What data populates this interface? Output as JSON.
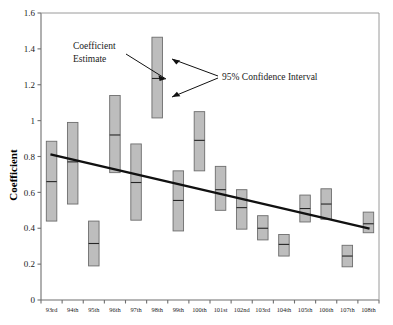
{
  "chart_data": {
    "type": "bar",
    "title": "",
    "subtitle": "",
    "xlabel": "",
    "ylabel": "Coefficient",
    "ylim": [
      0,
      1.6
    ],
    "yticks": [
      "0",
      "0.2",
      "0.4",
      "0.6",
      "0.8",
      "1",
      "1.2",
      "1.4",
      "1.6"
    ],
    "ytick_values": [
      0,
      0.2,
      0.4,
      0.6,
      0.8,
      1.0,
      1.2,
      1.4,
      1.6
    ],
    "grid": false,
    "legend_position": "none",
    "categories": [
      "93rd",
      "94th",
      "95th",
      "96th",
      "97th",
      "98th",
      "99th",
      "100th",
      "101st",
      "102nd",
      "103rd",
      "104th",
      "105th",
      "106th",
      "107th",
      "108th"
    ],
    "series": [
      {
        "name": "Coefficient Estimate",
        "values": [
          0.66,
          0.77,
          0.315,
          0.92,
          0.655,
          1.235,
          0.555,
          0.89,
          0.615,
          0.515,
          0.4,
          0.31,
          0.51,
          0.535,
          0.245,
          0.425
        ]
      },
      {
        "name": "95% Confidence Interval Upper",
        "values": [
          0.885,
          0.99,
          0.44,
          1.14,
          0.87,
          1.465,
          0.72,
          1.05,
          0.745,
          0.615,
          0.47,
          0.365,
          0.585,
          0.62,
          0.305,
          0.49
        ]
      },
      {
        "name": "95% Confidence Interval Lower",
        "values": [
          0.44,
          0.535,
          0.19,
          0.71,
          0.445,
          1.015,
          0.385,
          0.72,
          0.5,
          0.395,
          0.335,
          0.245,
          0.435,
          0.45,
          0.185,
          0.375
        ]
      }
    ],
    "trend_line": {
      "name": "fitted trend",
      "x_start_category": "93rd",
      "x_end_category": "108th",
      "y_start": 0.81,
      "y_end": 0.4
    },
    "annotations": [
      {
        "id": "coefficient-estimate",
        "text": "Coefficient",
        "text_line2": "Estimate"
      },
      {
        "id": "confidence-interval",
        "text": "95% Confidence Interval"
      }
    ],
    "colors": {
      "box_fill": "#bdbdbd",
      "box_stroke": "#6d6d6d",
      "estimate_line": "#262626",
      "trend_line": "#111111",
      "axis": "#6f6f6f",
      "text": "#1a1a1a",
      "background": "#ffffff"
    }
  }
}
